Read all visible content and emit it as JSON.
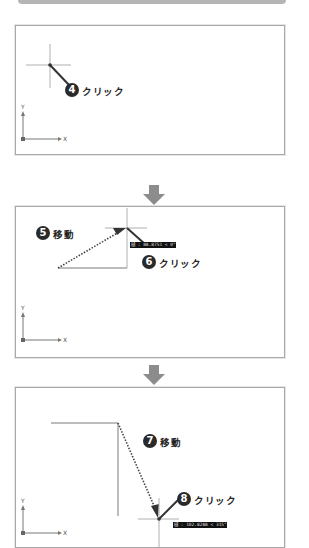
{
  "steps": [
    {
      "panel": "panel-1",
      "annotations": [
        {
          "number": "4",
          "action": "クリック"
        }
      ]
    },
    {
      "panel": "panel-2",
      "annotations": [
        {
          "number": "5",
          "action": "移動"
        },
        {
          "number": "6",
          "action": "クリック"
        }
      ],
      "tooltip": "極 : 88.8751 < 0°"
    },
    {
      "panel": "panel-3",
      "annotations": [
        {
          "number": "7",
          "action": "移動"
        },
        {
          "number": "8",
          "action": "クリック"
        }
      ],
      "tooltip": "極 : 102.8288 < 315°"
    }
  ],
  "ucs_icon": {
    "x_label": "X",
    "y_label": "Y"
  },
  "colors": {
    "panel_border": "#a9a9a9",
    "arrow": "#8c8c8c",
    "badge": "#2a2a2a",
    "crosshair": "#b0b0b0",
    "drawn_line": "#7a7a7a",
    "tooltip_bg": "#111111"
  }
}
